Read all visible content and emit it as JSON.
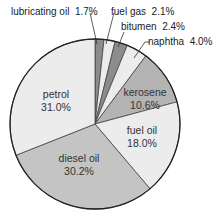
{
  "chart_data": {
    "type": "pie",
    "title": "",
    "start_angle_deg": 0,
    "direction": "clockwise",
    "slices": [
      {
        "label": "lubricating oil",
        "value": 1.7,
        "display": "1.7%",
        "color": "#8c8c8c"
      },
      {
        "label": "fuel gas",
        "value": 2.1,
        "display": "2.1%",
        "color": "#ececec"
      },
      {
        "label": "bitumen",
        "value": 2.4,
        "display": "2.4%",
        "color": "#8c8c8c"
      },
      {
        "label": "naphtha",
        "value": 4.0,
        "display": "4.0%",
        "color": "#ececec"
      },
      {
        "label": "kerosene",
        "value": 10.6,
        "display": "10.6%",
        "color": "#b4b4b4"
      },
      {
        "label": "fuel oil",
        "value": 18.0,
        "display": "18.0%",
        "color": "#ececec"
      },
      {
        "label": "diesel oil",
        "value": 30.2,
        "display": "30.2%",
        "color": "#c4c4c4"
      },
      {
        "label": "petrol",
        "value": 31.0,
        "display": "31.0%",
        "color": "#ececec"
      }
    ],
    "categories": [
      "lubricating oil",
      "fuel gas",
      "bitumen",
      "naphtha",
      "kerosene",
      "fuel oil",
      "diesel oil",
      "petrol"
    ],
    "values": [
      1.7,
      2.1,
      2.4,
      4.0,
      10.6,
      18.0,
      30.2,
      31.0
    ],
    "units": "%",
    "legend": "none (labels placed on/around slices)"
  },
  "labels": {
    "lubricating_oil": {
      "name": "lubricating oil",
      "pct": "1.7%"
    },
    "fuel_gas": {
      "name": "fuel gas",
      "pct": "2.1%"
    },
    "bitumen": {
      "name": "bitumen",
      "pct": "2.4%"
    },
    "naphtha": {
      "name": "naphtha",
      "pct": "4.0%"
    },
    "kerosene": {
      "name": "kerosene",
      "pct": "10.6%"
    },
    "fuel_oil": {
      "name": "fuel oil",
      "pct": "18.0%"
    },
    "diesel_oil": {
      "name": "diesel oil",
      "pct": "30.2%"
    },
    "petrol": {
      "name": "petrol",
      "pct": "31.0%"
    }
  }
}
